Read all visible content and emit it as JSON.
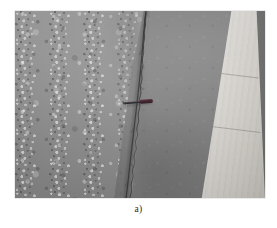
{
  "figure": {
    "caption": "a)",
    "alt_description": "Grayscale photograph of an asphalt pavement surface showing a longitudinal crack running top to bottom, with a small dark hand tool placed across the crack for scale and a light concrete shoulder band along the right edge.",
    "photo": {
      "subject": "pavement-longitudinal-crack",
      "regions": [
        {
          "name": "coarse-aggregate-surface",
          "position": "left",
          "tone": "#9b9b9b"
        },
        {
          "name": "smooth-asphalt-surface",
          "position": "right",
          "tone": "#868686"
        },
        {
          "name": "concrete-shoulder",
          "position": "far-right",
          "tone": "#e1ded8"
        },
        {
          "name": "dark-pavement-edge",
          "position": "right-margin",
          "tone": "#727272"
        }
      ],
      "features": [
        {
          "name": "longitudinal-crack",
          "orientation": "near-vertical",
          "tone": "#3c3a3c"
        },
        {
          "name": "scale-reference-tool",
          "description": "dark screwdriver laid across the crack",
          "tone": "#2a262e"
        }
      ]
    },
    "colors": {
      "page_background": "#ffffff",
      "asphalt_light": "#9b9b9b",
      "asphalt_dark": "#7e7e7e",
      "concrete": "#e1ded8",
      "crack": "#3c3a3c",
      "tool": "#2a262e",
      "caption_text": "#2b2b2b"
    }
  }
}
